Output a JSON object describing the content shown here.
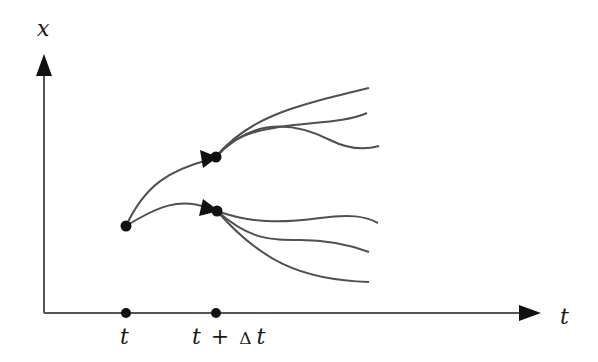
{
  "diagram": {
    "type": "branching-trajectories",
    "axes": {
      "vertical_label": "x",
      "horizontal_label": "t"
    },
    "ticks": [
      {
        "label": "t",
        "x": 126
      },
      {
        "label_parts": [
          "t",
          "+",
          "Δ",
          "t"
        ],
        "x": 216
      }
    ],
    "nodes": [
      {
        "id": "start",
        "label": "start point at t"
      },
      {
        "id": "upper",
        "label": "upper node at t+Δt"
      },
      {
        "id": "lower",
        "label": "lower node at t+Δt"
      }
    ],
    "branches": {
      "from_start": 2,
      "from_upper": 3,
      "from_lower": 3
    },
    "colors": {
      "line": "#505050",
      "axis": "#555555",
      "marker": "#111111",
      "background": "#ffffff"
    }
  }
}
